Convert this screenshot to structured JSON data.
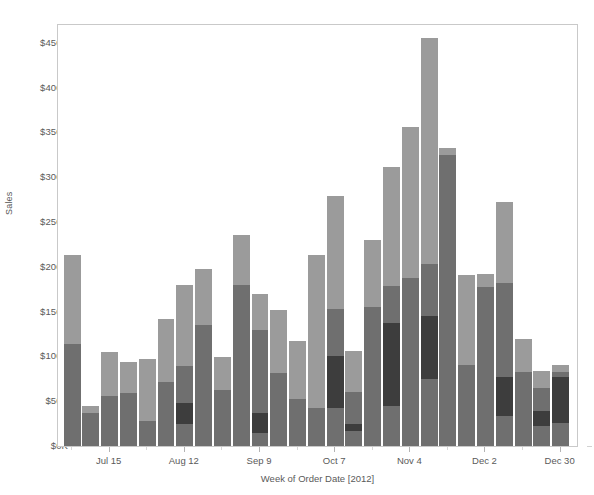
{
  "chart_data": {
    "type": "bar",
    "subtype": "stacked-bar",
    "title": "",
    "xlabel": "Week of Order Date [2012]",
    "ylabel": "Sales",
    "ylim": [
      0,
      470000
    ],
    "yticks": [
      0,
      50000,
      100000,
      150000,
      200000,
      250000,
      300000,
      350000,
      400000,
      450000
    ],
    "ytick_labels": [
      "$0K",
      "$50K",
      "$100K",
      "$150K",
      "$200K",
      "$250K",
      "$300K",
      "$350K",
      "$400K",
      "$450K"
    ],
    "xtick_labels": [
      "Jul 15",
      "Aug 12",
      "Sep 9",
      "Oct 7",
      "Nov 4",
      "Dec 2",
      "Dec 30"
    ],
    "xtick_indices": [
      2,
      6,
      10,
      14,
      18,
      22,
      26
    ],
    "grid": false,
    "legend": "none",
    "series": [
      {
        "name": "segment-1",
        "color": "#6f6f6f"
      },
      {
        "name": "segment-2",
        "color": "#3d3d3d"
      },
      {
        "name": "segment-3",
        "color": "#6f6f6f"
      },
      {
        "name": "segment-4",
        "color": "#9b9b9b"
      }
    ],
    "categories": [
      "Jul 1",
      "Jul 8",
      "Jul 15",
      "Jul 22",
      "Jul 29",
      "Aug 5",
      "Aug 12",
      "Aug 19",
      "Aug 26",
      "Sep 2",
      "Sep 9",
      "Sep 16",
      "Sep 23",
      "Sep 30",
      "Oct 7",
      "Oct 14",
      "Oct 21",
      "Oct 28",
      "Nov 4",
      "Nov 11",
      "Nov 18",
      "Nov 25",
      "Dec 2",
      "Dec 9",
      "Dec 16",
      "Dec 23",
      "Dec 30"
    ],
    "totals": [
      213000,
      45000,
      105000,
      94000,
      97000,
      142000,
      180000,
      198000,
      99000,
      236000,
      170000,
      152000,
      117000,
      213000,
      279000,
      106000,
      230000,
      312000,
      356000,
      455000,
      333000,
      191000,
      192000,
      272000,
      120000,
      84000,
      91000
    ],
    "stacks": [
      [
        28000,
        0,
        86000,
        99000
      ],
      [
        8000,
        0,
        29000,
        8000
      ],
      [
        25000,
        0,
        31000,
        49000
      ],
      [
        16000,
        0,
        43000,
        35000
      ],
      [
        18000,
        0,
        10000,
        69000
      ],
      [
        20000,
        0,
        52000,
        70000
      ],
      [
        25000,
        23000,
        41000,
        91000
      ],
      [
        12000,
        0,
        123000,
        63000
      ],
      [
        20000,
        0,
        43000,
        36000
      ],
      [
        17000,
        0,
        163000,
        56000
      ],
      [
        15000,
        22000,
        93000,
        40000
      ],
      [
        30000,
        0,
        52000,
        70000
      ],
      [
        14000,
        0,
        38000,
        65000
      ],
      [
        17000,
        0,
        25000,
        171000
      ],
      [
        42000,
        58000,
        53000,
        126000
      ],
      [
        17000,
        8000,
        35000,
        46000
      ],
      [
        25000,
        0,
        130000,
        75000
      ],
      [
        45000,
        92000,
        42000,
        133000
      ],
      [
        40000,
        0,
        148000,
        168000
      ],
      [
        75000,
        70000,
        58000,
        252000
      ],
      [
        20000,
        0,
        305000,
        8000
      ],
      [
        47000,
        0,
        43000,
        101000
      ],
      [
        40000,
        0,
        138000,
        14000
      ],
      [
        33000,
        44000,
        105000,
        90000
      ],
      [
        36000,
        0,
        47000,
        37000
      ],
      [
        22000,
        17000,
        26000,
        19000
      ],
      [
        26000,
        51000,
        6000,
        8000
      ]
    ]
  },
  "axes": {
    "y_title": "Sales",
    "x_title": "Week of Order Date [2012]"
  }
}
